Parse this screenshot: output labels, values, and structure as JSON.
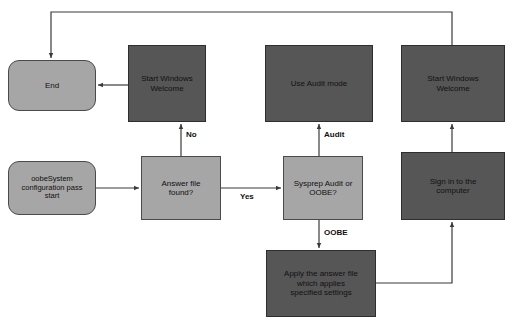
{
  "diagram": {
    "colors": {
      "dark_node": "#565656",
      "light_node": "#a6a6a6",
      "edge": "#3a3a3a",
      "text": "#111111",
      "background": "#ffffff"
    },
    "nodes": [
      {
        "id": "end",
        "label": "End",
        "shape": "rounded-rect",
        "fill": "light",
        "x": 8,
        "y": 60,
        "w": 88,
        "h": 51,
        "font_size": 8
      },
      {
        "id": "start-windows-welcome-1",
        "label": "Start Windows\nWelcome",
        "shape": "rect",
        "fill": "dark",
        "x": 128,
        "y": 45,
        "w": 78,
        "h": 77,
        "font_size": 8
      },
      {
        "id": "use-audit-mode",
        "label": "Use Audit mode",
        "shape": "rect",
        "fill": "dark",
        "x": 265,
        "y": 45,
        "w": 108,
        "h": 77,
        "font_size": 8
      },
      {
        "id": "start-windows-welcome-2",
        "label": "Start Windows\nWelcome",
        "shape": "rect",
        "fill": "dark",
        "x": 401,
        "y": 45,
        "w": 104,
        "h": 77,
        "font_size": 8
      },
      {
        "id": "oobesystem-start",
        "label": "oobeSystem\nconfiguration pass\nstart",
        "shape": "rounded-rect",
        "fill": "light",
        "x": 8,
        "y": 161,
        "w": 88,
        "h": 54,
        "font_size": 7.5
      },
      {
        "id": "answer-file-found",
        "label": "Answer file\nfound?",
        "shape": "rect",
        "fill": "light",
        "x": 141,
        "y": 156,
        "w": 80,
        "h": 64,
        "font_size": 8
      },
      {
        "id": "sysprep-audit-or-oobe",
        "label": "Sysprep Audit or\nOOBE?",
        "shape": "rect",
        "fill": "light",
        "x": 283,
        "y": 156,
        "w": 80,
        "h": 64,
        "font_size": 8
      },
      {
        "id": "sign-in-to-computer",
        "label": "Sign in to the\ncomputer",
        "shape": "rect",
        "fill": "dark",
        "x": 401,
        "y": 152,
        "w": 104,
        "h": 68,
        "font_size": 8
      },
      {
        "id": "apply-answer-file",
        "label": "Apply the answer file\nwhich applies\nspecified settings",
        "shape": "rect",
        "fill": "dark",
        "x": 266,
        "y": 250,
        "w": 110,
        "h": 67,
        "font_size": 8
      }
    ],
    "edge_labels": [
      {
        "id": "no",
        "text": "No",
        "x": 190,
        "y": 131
      },
      {
        "id": "yes",
        "text": "Yes",
        "x": 242,
        "y": 196
      },
      {
        "id": "audit",
        "text": "Audit",
        "x": 328,
        "y": 131
      },
      {
        "id": "oobe",
        "text": "OOBE",
        "x": 327,
        "y": 230
      }
    ],
    "edges": [
      {
        "from": "start-windows-welcome-1",
        "to": "end",
        "label": ""
      },
      {
        "from": "start-windows-welcome-2",
        "to": "end",
        "label": ""
      },
      {
        "from": "answer-file-found",
        "to": "start-windows-welcome-1",
        "label": "No"
      },
      {
        "from": "oobesystem-start",
        "to": "answer-file-found",
        "label": ""
      },
      {
        "from": "answer-file-found",
        "to": "sysprep-audit-or-oobe",
        "label": "Yes"
      },
      {
        "from": "sysprep-audit-or-oobe",
        "to": "use-audit-mode",
        "label": "Audit"
      },
      {
        "from": "sysprep-audit-or-oobe",
        "to": "apply-answer-file",
        "label": "OOBE"
      },
      {
        "from": "apply-answer-file",
        "to": "sign-in-to-computer",
        "label": ""
      },
      {
        "from": "sign-in-to-computer",
        "to": "start-windows-welcome-2",
        "label": ""
      }
    ]
  }
}
